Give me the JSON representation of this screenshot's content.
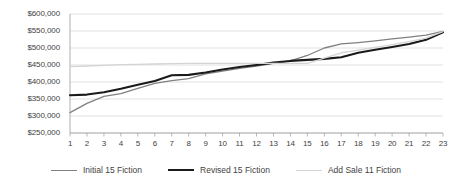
{
  "chart_data": {
    "type": "line",
    "title": "",
    "xlabel": "",
    "ylabel": "",
    "grid": true,
    "legend_position": "bottom",
    "categories": [
      "1",
      "2",
      "3",
      "4",
      "5",
      "6",
      "7",
      "8",
      "9",
      "10",
      "11",
      "12",
      "13",
      "14",
      "15",
      "16",
      "17",
      "18",
      "19",
      "20",
      "21",
      "22",
      "23"
    ],
    "ylim": [
      250000,
      600000
    ],
    "ytick_labels": [
      "$600,000",
      "$550,000",
      "$500,000",
      "$450,000",
      "$400,000",
      "$350,000",
      "$300,000",
      "$250,000"
    ],
    "ytick_values": [
      600000,
      550000,
      500000,
      450000,
      400000,
      350000,
      300000,
      250000
    ],
    "series": [
      {
        "name": "Initial  15 Fiction",
        "color": "#808080",
        "width": 1.3,
        "values": [
          310000,
          337000,
          358000,
          366000,
          381000,
          396000,
          404000,
          410000,
          424000,
          432000,
          440000,
          447000,
          455000,
          462000,
          478000,
          500000,
          512000,
          516000,
          521000,
          527000,
          532000,
          538000,
          549000
        ]
      },
      {
        "name": "Revised 15 Fiction",
        "color": "#1a1a1a",
        "width": 2.1,
        "values": [
          361000,
          363000,
          370000,
          380000,
          392000,
          403000,
          420000,
          421000,
          428000,
          437000,
          444000,
          450000,
          457000,
          462000,
          465000,
          468000,
          473000,
          486000,
          495000,
          503000,
          512000,
          524000,
          546000
        ]
      },
      {
        "name": "Add Sale 11 Fiction",
        "color": "#d4d4d4",
        "width": 1.3,
        "values": [
          445000,
          447000,
          449000,
          451000,
          452000,
          453000,
          454000,
          455000,
          455000,
          455000,
          455000,
          455000,
          455000,
          455000,
          455000,
          470000,
          486000,
          494000,
          502000,
          510000,
          519000,
          529000,
          548000
        ]
      }
    ]
  },
  "axes": {
    "y_labels": [
      "$600,000",
      "$550,000",
      "$500,000",
      "$450,000",
      "$400,000",
      "$350,000",
      "$300,000",
      "$250,000"
    ],
    "x_labels": [
      "1",
      "2",
      "3",
      "4",
      "5",
      "6",
      "7",
      "8",
      "9",
      "10",
      "11",
      "12",
      "13",
      "14",
      "15",
      "16",
      "17",
      "18",
      "19",
      "20",
      "21",
      "22",
      "23"
    ]
  },
  "legend": {
    "items": [
      {
        "label": "Initial  15 Fiction",
        "color": "#808080",
        "width": 1.3
      },
      {
        "label": "Revised 15 Fiction",
        "color": "#1a1a1a",
        "width": 2.1
      },
      {
        "label": "Add Sale 11 Fiction",
        "color": "#d4d4d4",
        "width": 1.3
      }
    ]
  },
  "colors": {
    "grid": "#d9d9d9",
    "axis": "#a6a6a6",
    "text": "#3f3f3f",
    "background": "#ffffff"
  }
}
